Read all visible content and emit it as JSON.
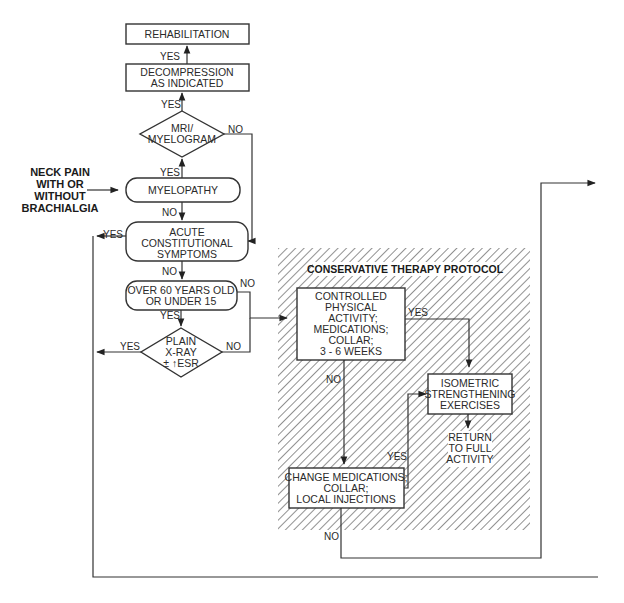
{
  "entry": {
    "lines": [
      "NECK PAIN",
      "WITH OR",
      "WITHOUT",
      "BRACHIALGIA"
    ]
  },
  "nodes": {
    "rehabilitation": {
      "lines": [
        "REHABILITATION"
      ]
    },
    "decompression": {
      "lines": [
        "DECOMPRESSION",
        "AS INDICATED"
      ]
    },
    "mri": {
      "lines": [
        "MRI/",
        "MYELOGRAM"
      ]
    },
    "myelopathy": {
      "lines": [
        "MYELOPATHY"
      ]
    },
    "acute": {
      "lines": [
        "ACUTE",
        "CONSTITUTIONAL",
        "SYMPTOMS"
      ]
    },
    "age": {
      "lines": [
        "OVER 60 YEARS OLD",
        "OR UNDER 15"
      ]
    },
    "xray": {
      "lines": [
        "PLAIN",
        "X-RAY",
        "± ↑ESR"
      ]
    },
    "controlled": {
      "lines": [
        "CONTROLLED",
        "PHYSICAL",
        "ACTIVITY;",
        "MEDICATIONS;",
        "COLLAR;",
        "3 - 6 WEEKS"
      ]
    },
    "isometric": {
      "lines": [
        "ISOMETRIC",
        "STRENGTHENING",
        "EXERCISES"
      ]
    },
    "return": {
      "lines": [
        "RETURN",
        "TO FULL",
        "ACTIVITY"
      ]
    },
    "change": {
      "lines": [
        "CHANGE MEDICATIONS;",
        "COLLAR;",
        "LOCAL INJECTIONS"
      ]
    }
  },
  "protocol": {
    "title": "CONSERVATIVE THERAPY PROTOCOL"
  },
  "labels": {
    "yes": "YES",
    "no": "NO"
  },
  "colors": {
    "line": "#333333",
    "hatch": "#555555",
    "background": "#ffffff"
  }
}
